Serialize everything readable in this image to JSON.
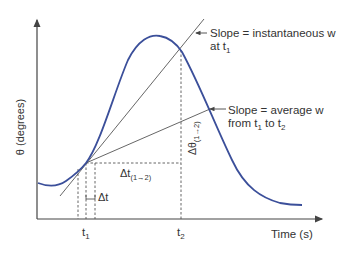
{
  "diagram": {
    "y_axis_label": "θ (degrees)",
    "x_axis_label": "Time (s)",
    "tick_t1": "t",
    "tick_t1_sub": "1",
    "tick_t2": "t",
    "tick_t2_sub": "2",
    "annotation_instantaneous_line1": "Slope = instantaneous w",
    "annotation_instantaneous_line2_prefix": "at t",
    "annotation_instantaneous_line2_sub": "1",
    "annotation_average_line1": "Slope = average w",
    "annotation_average_line2_a": "from t",
    "annotation_average_line2_sub1": "1",
    "annotation_average_line2_b": " to t",
    "annotation_average_line2_sub2": "2",
    "delta_t_small": "Δt",
    "delta_t_interval": "Δt",
    "delta_t_interval_sub": "(1→2)",
    "delta_theta": "Δθ",
    "delta_theta_sub": "(1→2)",
    "colors": {
      "curve": "#3b4f9a",
      "axes": "#444444",
      "lines": "#555555"
    }
  }
}
